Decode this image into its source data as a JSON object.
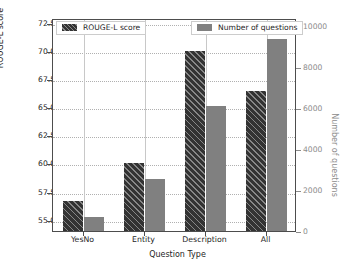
{
  "chart_data": {
    "type": "bar",
    "title": "",
    "categories": [
      "YesNo",
      "Entity",
      "Description",
      "All"
    ],
    "series": [
      {
        "name": "ROUGE-L score",
        "axis": "left",
        "color": "#333333",
        "hatch": "diagonal",
        "values": [
          56.7,
          60.0,
          70.0,
          66.4
        ]
      },
      {
        "name": "Number of questions",
        "axis": "right",
        "color": "#808080",
        "hatch": "none",
        "values": [
          700,
          2550,
          6100,
          9400
        ]
      }
    ],
    "xlabel": "Question Type",
    "ylabel": "ROUGE-L score",
    "ylabel_right": "Number of questions",
    "ylim": [
      54.0,
      72.9
    ],
    "ylim_right": [
      0,
      10400
    ],
    "yticks": [
      "55.0",
      "57.5",
      "60.0",
      "62.5",
      "65.0",
      "67.5",
      "70.0",
      "72.5"
    ],
    "ytick_values": [
      55.0,
      57.5,
      60.0,
      62.5,
      65.0,
      67.5,
      70.0,
      72.5
    ],
    "yticks_right": [
      "0",
      "2000",
      "4000",
      "6000",
      "8000",
      "10000"
    ],
    "ytick_values_right": [
      0,
      2000,
      4000,
      6000,
      8000,
      10000
    ],
    "grid": true,
    "legend_position": "upper-left and upper-right",
    "legend": [
      "ROUGE-L score",
      "Number of questions"
    ]
  },
  "axes": {
    "left_label": "ROUGE-L score",
    "right_label": "Number of questions",
    "x_label": "Question Type"
  },
  "legend": {
    "score_label": "ROUGE-L score",
    "count_label": "Number of questions"
  },
  "colors": {
    "score_bar": "#333333",
    "count_bar": "#808080",
    "right_axis_text": "#8c8c8c",
    "left_axis_text": "#262626",
    "grid": "#b0b0b0",
    "frame": "#4d4d4d",
    "background": "#ffffff"
  }
}
